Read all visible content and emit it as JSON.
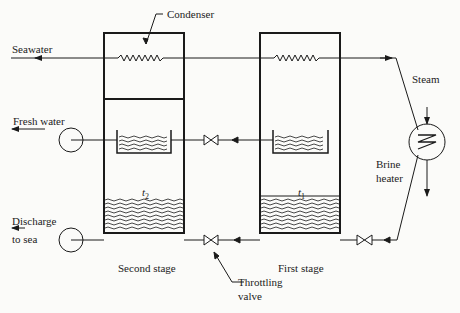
{
  "diagram": {
    "labels": {
      "condenser": "Condenser",
      "seawater": "Seawater",
      "steam": "Steam",
      "fresh_water": "Fresh water",
      "brine_heater_1": "Brine",
      "brine_heater_2": "heater",
      "t2_base": "t",
      "t2_sub": "2",
      "t1_base": "t",
      "t1_sub": "1",
      "discharge_1": "Discharge",
      "discharge_2": "to sea",
      "second_stage": "Second stage",
      "first_stage": "First stage",
      "throttling_1": "Throttling",
      "throttling_2": "valve"
    },
    "colors": {
      "line": "#1a1a1a",
      "background": "#fbfbf9"
    }
  }
}
